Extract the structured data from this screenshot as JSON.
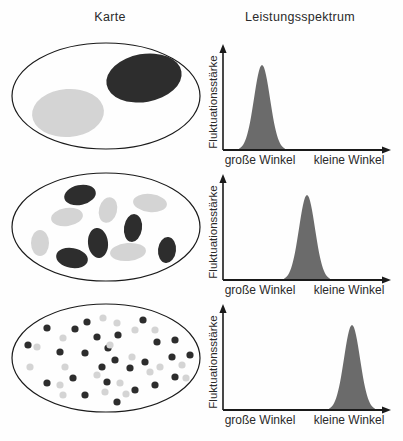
{
  "header": {
    "map_title": "Karte",
    "spectrum_title": "Leistungsspektrum"
  },
  "axes": {
    "y_label": "Fluktuationsstärke",
    "x_left": "große Winkel",
    "x_right": "kleine Winkel"
  },
  "colors": {
    "dark_blob": "#2d2d2d",
    "light_blob": "#d4d4d4",
    "peak_fill": "#6b6b6b",
    "line": "#1a1a1a"
  },
  "chart_data": [
    {
      "type": "area",
      "row": 1,
      "ylabel": "Fluktuationsstärke",
      "x_tick_labels": [
        "große Winkel",
        "kleine Winkel"
      ],
      "x_range": [
        0,
        1
      ],
      "peak_center_fraction": 0.24,
      "peak_sigma_fraction": 0.05,
      "peak_height_fraction": 1.0,
      "description": "Einzelner Peak über 'große Winkel' (Karte mit zwei großen Strukturen)"
    },
    {
      "type": "area",
      "row": 2,
      "ylabel": "Fluktuationsstärke",
      "x_tick_labels": [
        "große Winkel",
        "kleine Winkel"
      ],
      "x_range": [
        0,
        1
      ],
      "peak_center_fraction": 0.51,
      "peak_sigma_fraction": 0.05,
      "peak_height_fraction": 1.0,
      "description": "Einzelner Peak in der Mitte (Karte mit mittelgroßen Strukturen)"
    },
    {
      "type": "area",
      "row": 3,
      "ylabel": "Fluktuationsstärke",
      "x_tick_labels": [
        "große Winkel",
        "kleine Winkel"
      ],
      "x_range": [
        0,
        1
      ],
      "peak_center_fraction": 0.78,
      "peak_sigma_fraction": 0.05,
      "peak_height_fraction": 1.0,
      "description": "Einzelner Peak über 'kleine Winkel' (Karte mit vielen kleinen Strukturen)"
    }
  ],
  "rows": [
    {
      "name": "large-structures",
      "map": {
        "outline": {
          "cx": 100,
          "cy": 54,
          "rx": 94,
          "ry": 53
        },
        "blobs": [
          {
            "cx": 138,
            "cy": 36,
            "rx": 38,
            "ry": 24,
            "rot": -10,
            "shade": "dark"
          },
          {
            "cx": 62,
            "cy": 71,
            "rx": 36,
            "ry": 24,
            "rot": -4,
            "shade": "light"
          }
        ]
      },
      "spectrum": {
        "axis_x": 15,
        "axis_end": 182,
        "axis_top": 10,
        "baseline": 110,
        "peak_center": 54,
        "peak_height": 85,
        "sigma": 8,
        "half_width": 23
      }
    },
    {
      "name": "medium-structures",
      "map": {
        "outline": {
          "cx": 100,
          "cy": 55,
          "rx": 94,
          "ry": 54
        },
        "blobs": [
          {
            "cx": 74,
            "cy": 23,
            "rx": 16,
            "ry": 10,
            "rot": -12,
            "shade": "dark"
          },
          {
            "cx": 144,
            "cy": 31,
            "rx": 17,
            "ry": 9,
            "rot": 6,
            "shade": "light"
          },
          {
            "cx": 102,
            "cy": 38,
            "rx": 9,
            "ry": 13,
            "rot": 14,
            "shade": "light"
          },
          {
            "cx": 61,
            "cy": 45,
            "rx": 16,
            "ry": 9,
            "rot": -8,
            "shade": "light"
          },
          {
            "cx": 127,
            "cy": 56,
            "rx": 9,
            "ry": 14,
            "rot": 8,
            "shade": "dark"
          },
          {
            "cx": 34,
            "cy": 71,
            "rx": 9,
            "ry": 13,
            "rot": 0,
            "shade": "light"
          },
          {
            "cx": 92,
            "cy": 71,
            "rx": 10,
            "ry": 15,
            "rot": -6,
            "shade": "dark"
          },
          {
            "cx": 161,
            "cy": 78,
            "rx": 9,
            "ry": 13,
            "rot": 6,
            "shade": "dark"
          },
          {
            "cx": 122,
            "cy": 80,
            "rx": 18,
            "ry": 9,
            "rot": -5,
            "shade": "light"
          },
          {
            "cx": 66,
            "cy": 86,
            "rx": 16,
            "ry": 10,
            "rot": 10,
            "shade": "dark"
          }
        ]
      },
      "spectrum": {
        "axis_x": 15,
        "axis_end": 182,
        "axis_top": 10,
        "baseline": 110,
        "peak_center": 99,
        "peak_height": 85,
        "sigma": 8,
        "half_width": 23
      }
    },
    {
      "name": "small-structures",
      "map": {
        "outline": {
          "cx": 100,
          "cy": 56,
          "rx": 94,
          "ry": 54
        },
        "blobs": [
          {
            "cx": 41,
            "cy": 26,
            "r": 3.6,
            "shade": "dark"
          },
          {
            "cx": 69,
            "cy": 27,
            "r": 3.6,
            "shade": "dark"
          },
          {
            "cx": 81,
            "cy": 20,
            "r": 3.6,
            "shade": "dark"
          },
          {
            "cx": 22,
            "cy": 43,
            "r": 3.6,
            "shade": "dark"
          },
          {
            "cx": 54,
            "cy": 50,
            "r": 3.6,
            "shade": "dark"
          },
          {
            "cx": 79,
            "cy": 51,
            "r": 3.6,
            "shade": "dark"
          },
          {
            "cx": 91,
            "cy": 35,
            "r": 3.6,
            "shade": "dark"
          },
          {
            "cx": 102,
            "cy": 46,
            "r": 3.6,
            "shade": "dark"
          },
          {
            "cx": 41,
            "cy": 81,
            "r": 3.6,
            "shade": "dark"
          },
          {
            "cx": 67,
            "cy": 76,
            "r": 3.6,
            "shade": "dark"
          },
          {
            "cx": 96,
            "cy": 65,
            "r": 3.6,
            "shade": "dark"
          },
          {
            "cx": 101,
            "cy": 80,
            "r": 3.6,
            "shade": "dark"
          },
          {
            "cx": 79,
            "cy": 93,
            "r": 3.6,
            "shade": "dark"
          },
          {
            "cx": 137,
            "cy": 18,
            "r": 3.6,
            "shade": "dark"
          },
          {
            "cx": 112,
            "cy": 33,
            "r": 3.6,
            "shade": "dark"
          },
          {
            "cx": 151,
            "cy": 40,
            "r": 3.6,
            "shade": "dark"
          },
          {
            "cx": 169,
            "cy": 38,
            "r": 3.6,
            "shade": "dark"
          },
          {
            "cx": 109,
            "cy": 58,
            "r": 3.6,
            "shade": "dark"
          },
          {
            "cx": 124,
            "cy": 66,
            "r": 3.6,
            "shade": "dark"
          },
          {
            "cx": 139,
            "cy": 60,
            "r": 3.6,
            "shade": "dark"
          },
          {
            "cx": 166,
            "cy": 55,
            "r": 3.6,
            "shade": "dark"
          },
          {
            "cx": 184,
            "cy": 53,
            "r": 3.6,
            "shade": "dark"
          },
          {
            "cx": 169,
            "cy": 75,
            "r": 3.6,
            "shade": "dark"
          },
          {
            "cx": 129,
            "cy": 88,
            "r": 3.6,
            "shade": "dark"
          },
          {
            "cx": 149,
            "cy": 83,
            "r": 3.6,
            "shade": "dark"
          },
          {
            "cx": 111,
            "cy": 100,
            "r": 3.6,
            "shade": "dark"
          },
          {
            "cx": 31,
            "cy": 45,
            "r": 3.6,
            "shade": "light"
          },
          {
            "cx": 97,
            "cy": 16,
            "r": 3.6,
            "shade": "light"
          },
          {
            "cx": 111,
            "cy": 21,
            "r": 3.6,
            "shade": "light"
          },
          {
            "cx": 57,
            "cy": 36,
            "r": 3.6,
            "shade": "light"
          },
          {
            "cx": 24,
            "cy": 65,
            "r": 3.6,
            "shade": "light"
          },
          {
            "cx": 59,
            "cy": 65,
            "r": 3.6,
            "shade": "light"
          },
          {
            "cx": 91,
            "cy": 73,
            "r": 3.6,
            "shade": "light"
          },
          {
            "cx": 54,
            "cy": 83,
            "r": 3.6,
            "shade": "light"
          },
          {
            "cx": 57,
            "cy": 93,
            "r": 3.6,
            "shade": "light"
          },
          {
            "cx": 99,
            "cy": 90,
            "r": 3.6,
            "shade": "light"
          },
          {
            "cx": 129,
            "cy": 28,
            "r": 3.6,
            "shade": "light"
          },
          {
            "cx": 149,
            "cy": 28,
            "r": 3.6,
            "shade": "light"
          },
          {
            "cx": 104,
            "cy": 43,
            "r": 3.6,
            "shade": "light"
          },
          {
            "cx": 126,
            "cy": 55,
            "r": 3.6,
            "shade": "light"
          },
          {
            "cx": 154,
            "cy": 65,
            "r": 3.6,
            "shade": "light"
          },
          {
            "cx": 176,
            "cy": 63,
            "r": 3.6,
            "shade": "light"
          },
          {
            "cx": 144,
            "cy": 70,
            "r": 3.6,
            "shade": "light"
          },
          {
            "cx": 114,
            "cy": 81,
            "r": 3.6,
            "shade": "light"
          },
          {
            "cx": 180,
            "cy": 76,
            "r": 3.6,
            "shade": "light"
          },
          {
            "cx": 120,
            "cy": 92,
            "r": 3.6,
            "shade": "light"
          }
        ]
      },
      "spectrum": {
        "axis_x": 15,
        "axis_end": 182,
        "axis_top": 10,
        "baseline": 110,
        "peak_center": 144,
        "peak_height": 85,
        "sigma": 8,
        "half_width": 23
      }
    }
  ]
}
